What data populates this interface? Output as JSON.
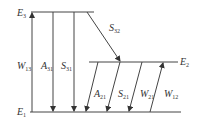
{
  "diagram": {
    "type": "energy-level-diagram",
    "levels": [
      {
        "id": "E3",
        "symbol": "E",
        "sub": "3"
      },
      {
        "id": "E2",
        "symbol": "E",
        "sub": "2"
      },
      {
        "id": "E1",
        "symbol": "E",
        "sub": "1"
      }
    ],
    "transitions": [
      {
        "id": "W13",
        "symbol": "W",
        "sub": "13",
        "from": "E1",
        "to": "E3",
        "direction": "up"
      },
      {
        "id": "A31",
        "symbol": "A",
        "sub": "31",
        "from": "E3",
        "to": "E1",
        "direction": "down"
      },
      {
        "id": "S31",
        "symbol": "S",
        "sub": "31",
        "from": "E3",
        "to": "E1",
        "direction": "down"
      },
      {
        "id": "S32",
        "symbol": "S",
        "sub": "32",
        "from": "E3",
        "to": "E2",
        "direction": "down"
      },
      {
        "id": "A21",
        "symbol": "A",
        "sub": "21",
        "from": "E2",
        "to": "E1",
        "direction": "down"
      },
      {
        "id": "S21",
        "symbol": "S",
        "sub": "21",
        "from": "E2",
        "to": "E1",
        "direction": "down"
      },
      {
        "id": "W21",
        "symbol": "W",
        "sub": "21",
        "from": "E2",
        "to": "E1",
        "direction": "down"
      },
      {
        "id": "W12",
        "symbol": "W",
        "sub": "12",
        "from": "E1",
        "to": "E2",
        "direction": "up"
      }
    ]
  }
}
